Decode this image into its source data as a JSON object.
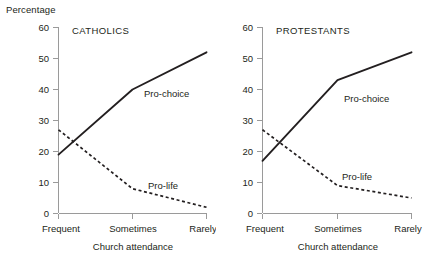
{
  "figure": {
    "y_axis_caption": "Percentage"
  },
  "panels": [
    {
      "key": "catholics",
      "title": "CATHOLICS",
      "x_caption": "Church attendance",
      "series_labels": {
        "pro_choice": "Pro-choice",
        "pro_life": "Pro-life"
      }
    },
    {
      "key": "protestants",
      "title": "PROTESTANTS",
      "x_caption": "Church attendance",
      "series_labels": {
        "pro_choice": "Pro-choice",
        "pro_life": "Pro-life"
      }
    }
  ],
  "axis": {
    "y_ticks": [
      "0",
      "10",
      "20",
      "30",
      "40",
      "50",
      "60"
    ],
    "x_ticks": [
      "Frequent",
      "Sometimes",
      "Rarely"
    ]
  },
  "chart_data": [
    {
      "type": "line",
      "title": "CATHOLICS",
      "xlabel": "Church attendance",
      "ylabel": "Percentage",
      "categories": [
        "Frequent",
        "Sometimes",
        "Rarely"
      ],
      "ylim": [
        0,
        60
      ],
      "yticks": [
        0,
        10,
        20,
        30,
        40,
        50,
        60
      ],
      "grid": false,
      "legend": "inline-annotations",
      "series": [
        {
          "name": "Pro-choice",
          "style": "solid",
          "values": [
            19,
            40,
            52
          ]
        },
        {
          "name": "Pro-life",
          "style": "dashed",
          "values": [
            27,
            8,
            2
          ]
        }
      ]
    },
    {
      "type": "line",
      "title": "PROTESTANTS",
      "xlabel": "Church attendance",
      "ylabel": "Percentage",
      "categories": [
        "Frequent",
        "Sometimes",
        "Rarely"
      ],
      "ylim": [
        0,
        60
      ],
      "yticks": [
        0,
        10,
        20,
        30,
        40,
        50,
        60
      ],
      "grid": false,
      "legend": "inline-annotations",
      "series": [
        {
          "name": "Pro-choice",
          "style": "solid",
          "values": [
            17,
            43,
            52
          ]
        },
        {
          "name": "Pro-life",
          "style": "dashed",
          "values": [
            27,
            9,
            5
          ]
        }
      ]
    }
  ]
}
